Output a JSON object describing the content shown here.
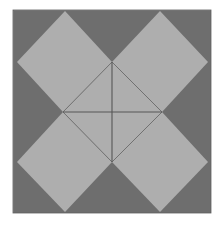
{
  "figure": {
    "name": "pinwheel-quilt-block",
    "canvas": {
      "width": 221,
      "height": 226,
      "background": "#ffffff"
    },
    "colors": {
      "background": "#ffffff",
      "dark_gray": "#6e6e6e",
      "light_gray": "#aeaeae",
      "line": "#565656",
      "edge_shadow": "#868686"
    },
    "outer_square": {
      "label": "dark background square",
      "x": 13,
      "y": 10,
      "width": 198,
      "height": 203,
      "fill": "#6e6e6e"
    },
    "anchors": {
      "left": 13,
      "right": 211,
      "top": 10,
      "bottom": 213,
      "mid_x": 112,
      "mid_y": 112,
      "edge_mid_top_x": 112,
      "edge_mid_bottom_x": 112,
      "diamond_apex_top_left_x": 65,
      "diamond_apex_top_right_x": 160,
      "diamond_vertex_left_y": 62,
      "diamond_vertex_right_y": 62,
      "diamond_vertex_left_lower_y": 162,
      "center_top_y": 62,
      "center_bottom_y": 162,
      "center_left_x": 63,
      "center_right_x": 162
    },
    "diamonds": [
      {
        "name": "diamond-top-left",
        "fill": "#aeaeae",
        "points": "65,11 112,62 63,112 17,62"
      },
      {
        "name": "diamond-top-right",
        "fill": "#aeaeae",
        "points": "160,11 208,62 162,112 112,62"
      },
      {
        "name": "diamond-bottom-left",
        "fill": "#aeaeae",
        "points": "63,112 112,162 65,212 17,162"
      },
      {
        "name": "diamond-bottom-right",
        "fill": "#aeaeae",
        "points": "162,112 208,162 160,212 112,162"
      }
    ],
    "center_diamond": {
      "name": "center-diamond",
      "fill": "#aeaeae",
      "points": "112,62 162,112 112,162 63,112"
    },
    "cross_lines": [
      {
        "name": "horizontal-center-line",
        "x1": 63,
        "y1": 112,
        "x2": 162,
        "y2": 112,
        "stroke": "#565656",
        "width": 1.1
      },
      {
        "name": "vertical-center-line",
        "x1": 112,
        "y1": 62,
        "x2": 112,
        "y2": 162,
        "stroke": "#565656",
        "width": 1.1
      }
    ],
    "seam_lines": [
      {
        "name": "seam-center-top-left",
        "x1": 112,
        "y1": 62,
        "x2": 63,
        "y2": 112
      },
      {
        "name": "seam-center-top-right",
        "x1": 112,
        "y1": 62,
        "x2": 162,
        "y2": 112
      },
      {
        "name": "seam-center-bottom-left",
        "x1": 63,
        "y1": 112,
        "x2": 112,
        "y2": 162
      },
      {
        "name": "seam-center-bottom-right",
        "x1": 162,
        "y1": 112,
        "x2": 112,
        "y2": 162
      }
    ],
    "notches": [
      {
        "name": "notch-top",
        "points": "65,11 112,62 160,11"
      },
      {
        "name": "notch-left",
        "points": "17,62 63,112 17,162"
      },
      {
        "name": "notch-right",
        "points": "208,62 162,112 208,162"
      },
      {
        "name": "notch-bottom",
        "points": "65,212 112,162 160,212"
      }
    ]
  }
}
